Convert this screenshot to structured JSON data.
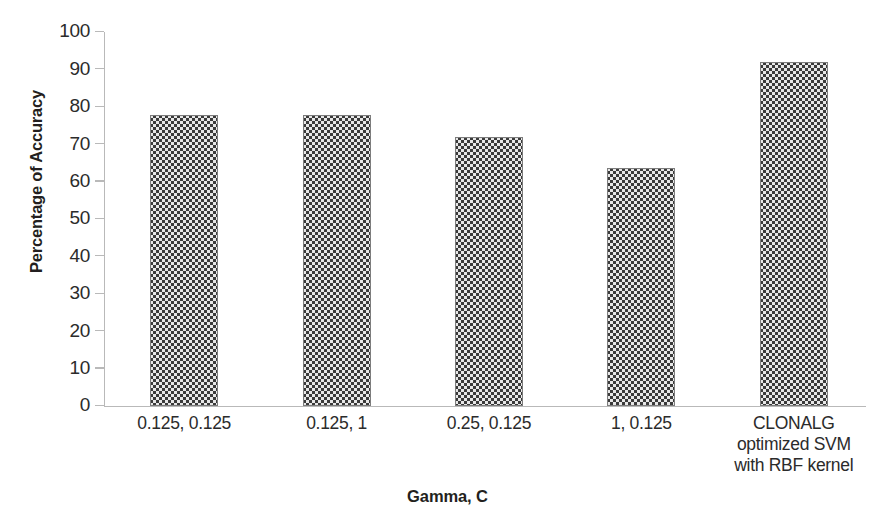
{
  "chart_data": {
    "type": "bar",
    "title": "",
    "xlabel": "Gamma, C",
    "ylabel": "Percentage of Accuracy",
    "categories": [
      "0.125, 0.125",
      "0.125, 1",
      "0.25, 0.125",
      "1, 0.125",
      "CLONALG\noptimized SVM\nwith RBF kernel"
    ],
    "category_lines": [
      [
        "0.125, 0.125"
      ],
      [
        "0.125, 1"
      ],
      [
        "0.25, 0.125"
      ],
      [
        "1, 0.125"
      ],
      [
        "CLONALG",
        "optimized SVM",
        "with RBF kernel"
      ]
    ],
    "values": [
      77.8,
      77.8,
      72.0,
      63.6,
      92.0
    ],
    "ylim": [
      0,
      100
    ],
    "ytick_labels": [
      "100",
      "90",
      "80",
      "70",
      "60",
      "50",
      "40",
      "30",
      "20",
      "10",
      "0"
    ],
    "ytick_values": [
      100,
      90,
      80,
      70,
      60,
      50,
      40,
      30,
      20,
      10,
      0
    ],
    "grid": false,
    "legend": "none",
    "series_name": "Percentage of Accuracy",
    "bar_fill": "#8f8f8f",
    "axis_color": "#b9b9b9",
    "text_color": "#231f20"
  }
}
